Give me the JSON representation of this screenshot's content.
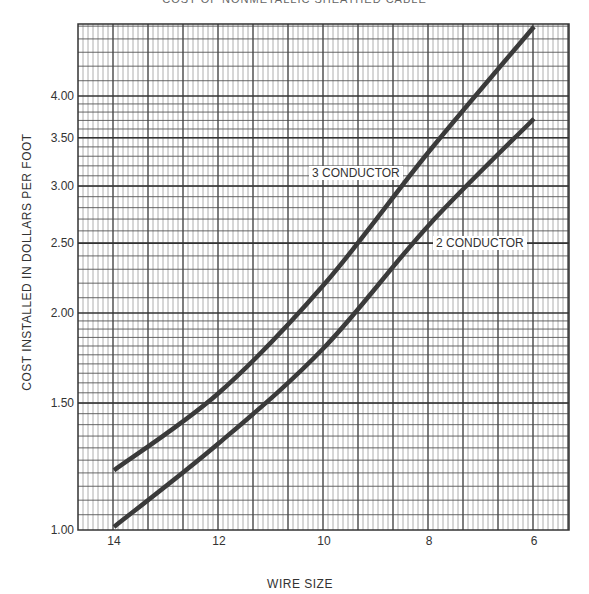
{
  "chart_data": {
    "type": "line",
    "title": "COST OF NONMETALLIC SHEATHED CABLE",
    "xlabel": "WIRE SIZE",
    "ylabel": "COST INSTALLED IN DOLLARS PER FOOT",
    "x": [
      14,
      12,
      10,
      8,
      6
    ],
    "x_tick_labels": [
      "14",
      "12",
      "10",
      "8",
      "6"
    ],
    "y_scale": "log",
    "ylim": [
      1.0,
      5.05
    ],
    "y_tick_values": [
      1.0,
      1.5,
      2.0,
      2.5,
      3.0,
      3.5,
      4.0
    ],
    "y_tick_labels": [
      "1.00",
      "1.50",
      "2.00",
      "2.50",
      "3.00",
      "3.50",
      "4.00"
    ],
    "grid": true,
    "legend": "inline labels",
    "series": [
      {
        "name": "3 CONDUCTOR",
        "values": [
          1.21,
          1.55,
          2.19,
          3.35,
          4.99
        ]
      },
      {
        "name": "2 CONDUCTOR",
        "values": [
          1.01,
          1.32,
          1.79,
          2.65,
          3.72
        ]
      }
    ],
    "annotations": [
      {
        "text": "3 CONDUCTOR",
        "x": 8.6,
        "y": 3.0
      },
      {
        "text": "2 CONDUCTOR",
        "x": 7.6,
        "y": 2.5
      }
    ]
  }
}
